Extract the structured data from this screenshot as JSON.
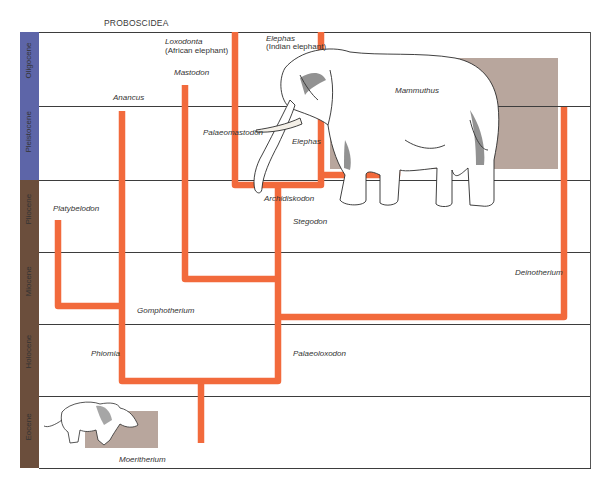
{
  "diagram": {
    "title": "PROBOSCIDEA",
    "colors": {
      "branch": "#f26a3c",
      "frame_line": "#3d3d3d",
      "era_blue": "#5d65a8",
      "era_brown": "#6b4e3c",
      "specimen_box": "#b8a69d"
    },
    "eras": [
      {
        "label": "Oligocene",
        "band": "blue"
      },
      {
        "label": "Pleistocene",
        "band": "blue"
      },
      {
        "label": "Pliocene",
        "band": "brown"
      },
      {
        "label": "Miocene",
        "band": "brown"
      },
      {
        "label": "Holocene",
        "band": "brown"
      },
      {
        "label": "Eocene",
        "band": "brown"
      }
    ],
    "taxa": {
      "loxodonta": "Loxodonta",
      "loxodonta_common": "(African elephant)",
      "elephas_top": "Elephas",
      "elephas_common": "(Indian elephant)",
      "mastodon": "Mastodon",
      "anancus": "Anancus",
      "mammuthus": "Mammuthus",
      "palaeomastodon": "Palaeomastodon",
      "elephas": "Elephas",
      "archidiskodon": "Archidiskodon",
      "stegodon": "Stegodon",
      "platybelodon": "Platybelodon",
      "deinotherium": "Deinotherium",
      "gomphotherium": "Gomphotherium",
      "phiomia": "Phiomia",
      "palaeoloxodon": "Palaeoloxodon",
      "moeritherium": "Moeritherium"
    },
    "illustrations": [
      {
        "name": "elephant-illustration",
        "overlay_box": "Mammuthus"
      },
      {
        "name": "moeritherium-illustration",
        "overlay_box": "Moeritherium"
      }
    ]
  }
}
